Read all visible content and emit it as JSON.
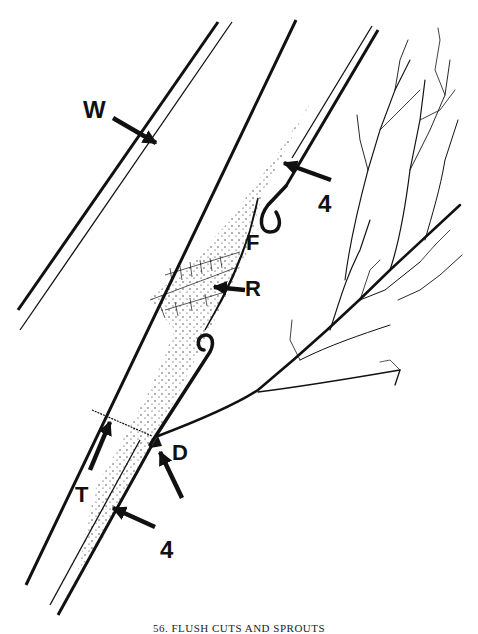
{
  "figure": {
    "caption": "56. FLUSH CUTS AND SPROUTS",
    "labels": {
      "W": "W",
      "four_top": "4",
      "F": "F",
      "R": "R",
      "D": "D",
      "T": "T",
      "four_bottom": "4"
    },
    "colors": {
      "ink": "#111111",
      "background": "#ffffff"
    }
  }
}
